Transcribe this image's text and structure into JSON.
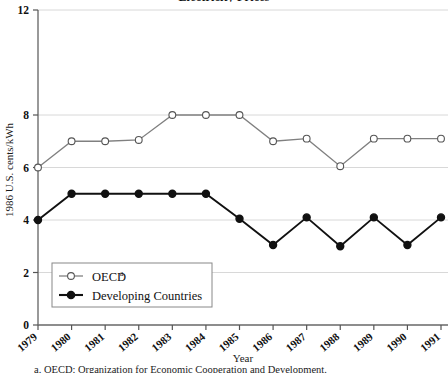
{
  "chart_data": {
    "type": "line",
    "title": "Electricity Prices",
    "xlabel": "Year",
    "ylabel": "1986 U.S. cents/kWh",
    "categories": [
      1979,
      1980,
      1981,
      1982,
      1983,
      1984,
      1985,
      1986,
      1987,
      1988,
      1989,
      1990,
      1991
    ],
    "x_tick_labels": [
      "1979",
      "1980",
      "1981",
      "1982",
      "1983",
      "1984",
      "1985",
      "1986",
      "1987",
      "1988",
      "1989",
      "1990",
      "1991"
    ],
    "y_tick_labels": [
      "0",
      "2",
      "4",
      "6",
      "8",
      "12"
    ],
    "y_tick_values": [
      0,
      2,
      4,
      6,
      8,
      12
    ],
    "ylim": [
      0,
      12
    ],
    "grid": "horizontal",
    "legend_position": "lower-left",
    "series": [
      {
        "name": "OECD",
        "name_superscript": "a",
        "marker": "open-circle",
        "color": "#808080",
        "values": [
          6.0,
          7.0,
          7.0,
          7.05,
          8.0,
          8.0,
          8.0,
          7.0,
          7.1,
          6.05,
          7.1,
          7.1,
          7.1
        ]
      },
      {
        "name": "Developing Countries",
        "marker": "filled-circle",
        "color": "#111111",
        "values": [
          4.0,
          5.0,
          5.0,
          5.0,
          5.0,
          5.0,
          4.05,
          3.05,
          4.1,
          3.0,
          4.1,
          3.05,
          4.1
        ]
      }
    ],
    "footnote": "a.  OECD: Organization for Economic Cooperation and Development."
  },
  "legend": {
    "items": [
      {
        "label": "OECD",
        "superscript": "a"
      },
      {
        "label": "Developing Countries",
        "superscript": ""
      }
    ]
  }
}
